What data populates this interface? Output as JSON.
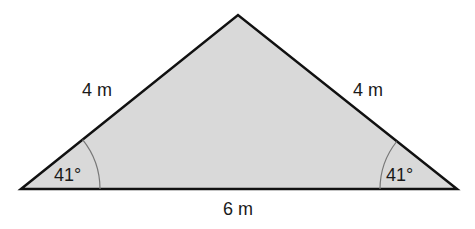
{
  "diagram": {
    "shape": "isosceles triangle",
    "fill_color": "#d9d9d9",
    "stroke_color": "#111111",
    "sides": {
      "left": "4 m",
      "right": "4 m",
      "base": "6 m"
    },
    "angles": {
      "left_base": "41°",
      "right_base": "41°"
    }
  }
}
